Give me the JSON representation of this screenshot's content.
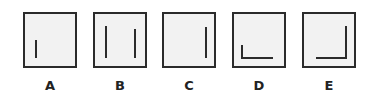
{
  "options": [
    {
      "label": "A",
      "left": 23,
      "segments": [
        {
          "x": 10,
          "y": 26,
          "w": 2,
          "h": 18
        }
      ]
    },
    {
      "label": "B",
      "left": 93,
      "segments": [
        {
          "x": 10,
          "y": 12,
          "w": 2,
          "h": 32
        },
        {
          "x": 39,
          "y": 15,
          "w": 2,
          "h": 29
        }
      ]
    },
    {
      "label": "C",
      "left": 162,
      "segments": [
        {
          "x": 41,
          "y": 13,
          "w": 2,
          "h": 31
        }
      ]
    },
    {
      "label": "D",
      "left": 232,
      "segments": [
        {
          "x": 7,
          "y": 31,
          "w": 2,
          "h": 14
        },
        {
          "x": 7,
          "y": 43,
          "w": 32,
          "h": 2
        }
      ]
    },
    {
      "label": "E",
      "left": 302,
      "segments": [
        {
          "x": 41,
          "y": 12,
          "w": 2,
          "h": 33
        },
        {
          "x": 12,
          "y": 43,
          "w": 31,
          "h": 2
        }
      ]
    }
  ],
  "colors": {
    "stroke": "#2b2b2b",
    "fill": "#f2f2f2"
  }
}
